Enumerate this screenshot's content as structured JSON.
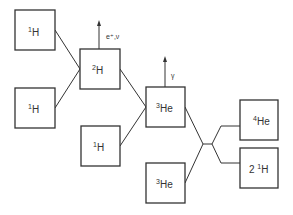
{
  "diagram": {
    "nodes": [
      {
        "id": "h1a",
        "mass": "1",
        "symbol": "H",
        "prefix": ""
      },
      {
        "id": "h1b",
        "mass": "1",
        "symbol": "H",
        "prefix": ""
      },
      {
        "id": "h2",
        "mass": "2",
        "symbol": "H",
        "prefix": ""
      },
      {
        "id": "h1c",
        "mass": "1",
        "symbol": "H",
        "prefix": ""
      },
      {
        "id": "he3a",
        "mass": "3",
        "symbol": "He",
        "prefix": ""
      },
      {
        "id": "he3b",
        "mass": "3",
        "symbol": "He",
        "prefix": ""
      },
      {
        "id": "he4",
        "mass": "4",
        "symbol": "He",
        "prefix": ""
      },
      {
        "id": "h1out",
        "mass": "1",
        "symbol": "H",
        "prefix": "2 "
      }
    ],
    "emissions": [
      {
        "from": "h2",
        "label": "e⁺,ν"
      },
      {
        "from": "he3a",
        "label": "γ"
      }
    ],
    "edges": [
      {
        "from": "h1a",
        "to": "h2"
      },
      {
        "from": "h1b",
        "to": "h2"
      },
      {
        "from": "h2",
        "to": "he3a"
      },
      {
        "from": "h1c",
        "to": "he3a"
      },
      {
        "from": "he3a",
        "to": "junction"
      },
      {
        "from": "he3b",
        "to": "junction"
      },
      {
        "from": "junction",
        "to": "he4"
      },
      {
        "from": "junction",
        "to": "h1out"
      }
    ]
  }
}
